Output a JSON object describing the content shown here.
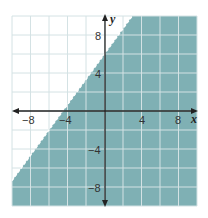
{
  "chart_data": {
    "type": "area",
    "title": "",
    "xlabel": "x",
    "ylabel": "y",
    "xlim": [
      -10,
      10
    ],
    "ylim": [
      -10,
      10
    ],
    "grid": true,
    "grid_step": 2,
    "x_ticks": [
      -8,
      -4,
      4,
      8
    ],
    "y_ticks": [
      8,
      4,
      -4,
      -8
    ],
    "x_tick_labels": [
      "−8",
      "−4",
      "4",
      "8"
    ],
    "y_tick_labels": [
      "8",
      "4",
      "−4",
      "−8"
    ],
    "boundary": {
      "equation": "y = (4/3)x + 6",
      "slope": 1.3333,
      "intercept": 6,
      "style": "dashed",
      "points": [
        [
          -10,
          -7.33
        ],
        [
          3,
          10
        ]
      ]
    },
    "shaded_region": "below",
    "colors": {
      "shade": "#7fb0b4",
      "grid": "#d6e6e8",
      "axis": "#222222",
      "background": "#ffffff"
    }
  }
}
